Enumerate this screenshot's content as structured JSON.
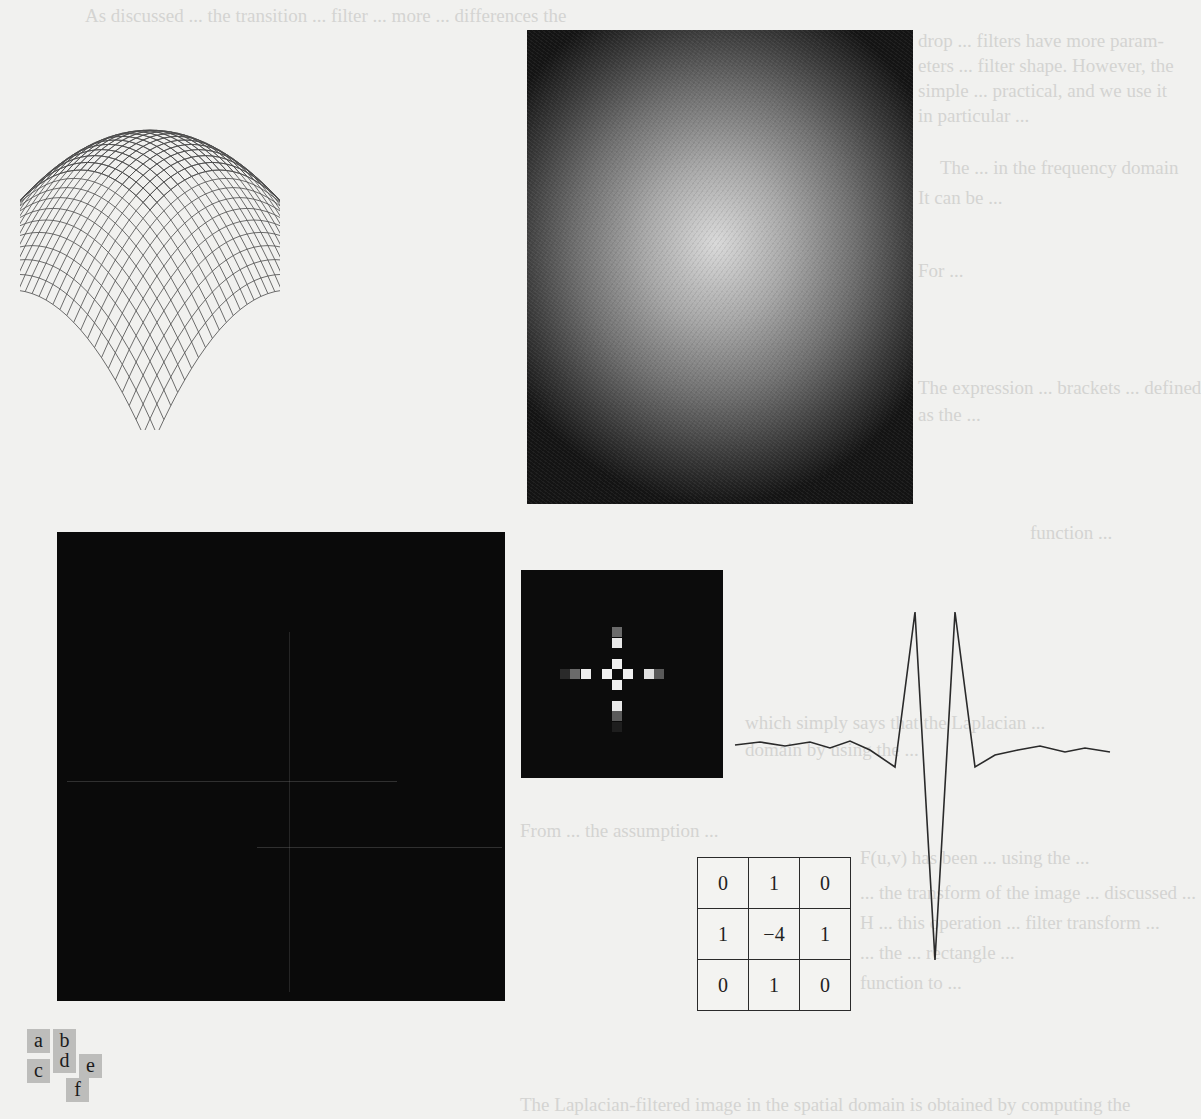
{
  "page": {
    "background": "#f1f1ef",
    "bleed_through_text": [
      "As discussed ... the transition ... filter ... more ... differences the",
      "drop ... filters have more param-",
      "eters ... filter shape. However, the",
      "simple ... practical, and we use it",
      "in particular ... ",
      "The ... in the frequency domain",
      "It can be ... ",
      "For ... ",
      "The expression ... brackets ... defined",
      "as the ... ",
      "function ... ",
      "which simply says that the Laplacian ... ",
      "domain by using the ... ",
      "From ... the assumption ...",
      "F(u,v) has been ... using the ... ",
      "... the transform of the image ... discussed ...",
      "H ... this operation ... filter transform ...",
      "... the ... rectangle ...",
      "function to ... ",
      "The Laplacian-filtered image in the spatial domain is obtained by computing the"
    ]
  },
  "figure": {
    "panels": [
      {
        "id": "a",
        "kind": "3d-mesh-plot",
        "description": "Inverted paraboloid wireframe surface (frequency-domain Laplacian filter, perspective plot)"
      },
      {
        "id": "b",
        "kind": "image",
        "description": "Filter displayed as image: bright center fading to dark corners"
      },
      {
        "id": "c",
        "kind": "image",
        "description": "Spatial-domain filter image, nearly black with faint center lines"
      },
      {
        "id": "d",
        "kind": "image",
        "description": "Zoomed center of spatial filter showing cross pattern"
      },
      {
        "id": "e",
        "kind": "line-profile",
        "description": "Intensity profile through center of spatial filter"
      },
      {
        "id": "f",
        "kind": "mask-table",
        "description": "3x3 Laplacian mask"
      }
    ],
    "mask": {
      "rows": [
        [
          "0",
          "1",
          "0"
        ],
        [
          "1",
          "−4",
          "1"
        ],
        [
          "0",
          "1",
          "0"
        ]
      ]
    },
    "legend": {
      "labels": [
        "a",
        "b",
        "c",
        "d",
        "e",
        "f"
      ],
      "tile_color": "#bdbdbb"
    },
    "colors": {
      "ink": "#2a2a2a",
      "mesh": "#4a4a4a",
      "dark_panel": "#0a0a0a"
    }
  },
  "chart_data": {
    "type": "line",
    "title": "",
    "xlabel": "",
    "ylabel": "",
    "x": [
      0,
      1,
      2,
      3,
      4,
      5,
      6,
      7,
      8,
      9,
      10,
      11,
      12,
      13,
      14,
      15,
      16,
      17,
      18,
      19,
      20,
      21,
      22,
      23,
      24,
      25,
      26
    ],
    "values": [
      0.02,
      0.03,
      0.01,
      0.03,
      0.0,
      0.04,
      -0.01,
      -0.08,
      1.0,
      -1.6,
      1.0,
      -0.08,
      -0.01,
      0.03,
      0.06,
      0.02,
      0.04,
      0.01,
      0.03,
      0.01,
      0.02,
      0.0,
      0.0,
      0.0,
      0.0,
      0.0,
      0.0
    ],
    "grid": false,
    "legend": null
  }
}
